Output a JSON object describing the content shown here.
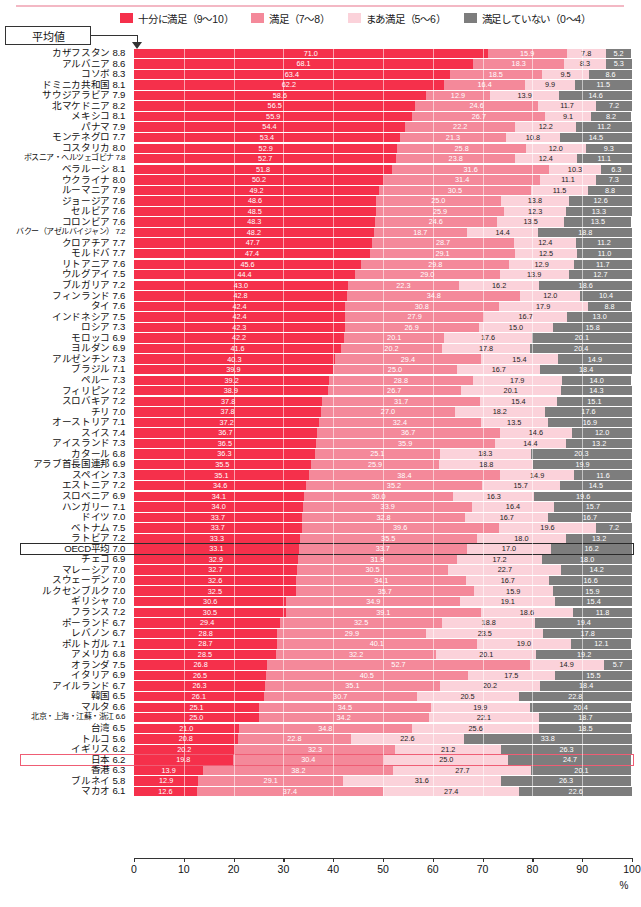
{
  "legend": {
    "items": [
      {
        "label": "十分に満足（9～10）",
        "color": "#f5304b",
        "key": "very_satisfied"
      },
      {
        "label": "満足（7～8）",
        "color": "#f4899a",
        "key": "satisfied"
      },
      {
        "label": "まあ満足（5～6）",
        "color": "#fbd2da",
        "key": "somewhat_satisfied"
      },
      {
        "label": "満足していない（0～4）",
        "color": "#7d7d7d",
        "key": "not_satisfied"
      }
    ]
  },
  "callout": {
    "label": "平均値"
  },
  "axis": {
    "unit": "%",
    "ticks": [
      0,
      10,
      20,
      30,
      40,
      50,
      60,
      70,
      80,
      90,
      100
    ]
  },
  "chart_data": {
    "type": "bar",
    "orientation": "horizontal",
    "stacked": true,
    "title": "",
    "xlabel": "%",
    "ylabel": "",
    "xlim": [
      0,
      100
    ],
    "grid": false,
    "legend_position": "top",
    "series": [
      {
        "name": "十分に満足（9～10）",
        "color": "#f5304b"
      },
      {
        "name": "満足（7～8）",
        "color": "#f4899a"
      },
      {
        "name": "まあ満足（5～6）",
        "color": "#fbd2da"
      },
      {
        "name": "満足していない（0～4）",
        "color": "#7d7d7d"
      }
    ],
    "rows": [
      {
        "name": "カザフスタン",
        "mean": "8.8",
        "values": [
          71.0,
          15.9,
          7.8,
          5.2
        ]
      },
      {
        "name": "アルバニア",
        "mean": "8.6",
        "values": [
          68.1,
          18.3,
          8.3,
          5.3
        ]
      },
      {
        "name": "コソボ",
        "mean": "8.3",
        "values": [
          63.4,
          18.5,
          9.5,
          8.6
        ]
      },
      {
        "name": "ドミニカ共和国",
        "mean": "8.1",
        "values": [
          62.2,
          16.4,
          9.9,
          11.5
        ]
      },
      {
        "name": "サウジアラビア",
        "mean": "7.9",
        "values": [
          58.6,
          12.9,
          13.9,
          14.6
        ]
      },
      {
        "name": "北マケドニア",
        "mean": "8.2",
        "values": [
          56.5,
          24.6,
          11.7,
          7.2
        ]
      },
      {
        "name": "メキシコ",
        "mean": "8.1",
        "values": [
          55.9,
          26.7,
          9.1,
          8.2
        ]
      },
      {
        "name": "パナマ",
        "mean": "7.9",
        "values": [
          54.4,
          22.2,
          12.2,
          11.2
        ]
      },
      {
        "name": "モンテネグロ",
        "mean": "7.7",
        "values": [
          53.4,
          21.3,
          10.8,
          14.5
        ]
      },
      {
        "name": "コスタリカ",
        "mean": "8.0",
        "values": [
          52.9,
          25.8,
          12.0,
          9.3
        ]
      },
      {
        "name": "ボスニア・ヘルツェゴビナ",
        "mean": "7.8",
        "values": [
          52.7,
          23.8,
          12.4,
          11.1
        ]
      },
      {
        "name": "ベラルーシ",
        "mean": "8.1",
        "values": [
          51.8,
          31.6,
          10.3,
          6.3
        ]
      },
      {
        "name": "ウクライナ",
        "mean": "8.0",
        "values": [
          50.2,
          31.4,
          11.1,
          7.3
        ]
      },
      {
        "name": "ルーマニア",
        "mean": "7.9",
        "values": [
          49.2,
          30.5,
          11.5,
          8.8
        ]
      },
      {
        "name": "ジョージア",
        "mean": "7.6",
        "values": [
          48.6,
          25.0,
          13.8,
          12.6
        ]
      },
      {
        "name": "セルビア",
        "mean": "7.6",
        "values": [
          48.5,
          25.9,
          12.3,
          13.3
        ]
      },
      {
        "name": "コロンビア",
        "mean": "7.6",
        "values": [
          48.3,
          24.6,
          13.5,
          13.5
        ]
      },
      {
        "name": "バクー（アゼルバイジャン）",
        "mean": "7.2",
        "values": [
          48.2,
          18.7,
          14.4,
          18.8
        ]
      },
      {
        "name": "クロアチア",
        "mean": "7.7",
        "values": [
          47.7,
          28.7,
          12.4,
          11.2
        ]
      },
      {
        "name": "モルドバ",
        "mean": "7.7",
        "values": [
          47.4,
          29.1,
          12.5,
          11.0
        ]
      },
      {
        "name": "リトアニア",
        "mean": "7.6",
        "values": [
          45.6,
          29.8,
          12.9,
          11.7
        ]
      },
      {
        "name": "ウルグアイ",
        "mean": "7.5",
        "values": [
          44.4,
          29.0,
          13.9,
          12.7
        ]
      },
      {
        "name": "ブルガリア",
        "mean": "7.2",
        "values": [
          43.0,
          22.3,
          16.2,
          18.6
        ]
      },
      {
        "name": "フィンランド",
        "mean": "7.6",
        "values": [
          42.8,
          34.8,
          12.0,
          10.4
        ]
      },
      {
        "name": "タイ",
        "mean": "7.6",
        "values": [
          42.4,
          30.8,
          17.9,
          8.8
        ]
      },
      {
        "name": "インドネシア",
        "mean": "7.5",
        "values": [
          42.4,
          27.9,
          16.7,
          13.0
        ]
      },
      {
        "name": "ロシア",
        "mean": "7.3",
        "values": [
          42.3,
          26.9,
          15.0,
          15.8
        ]
      },
      {
        "name": "モロッコ",
        "mean": "6.9",
        "values": [
          42.2,
          20.1,
          17.6,
          20.1
        ]
      },
      {
        "name": "ヨルダン",
        "mean": "6.9",
        "values": [
          41.6,
          20.2,
          17.8,
          20.4
        ]
      },
      {
        "name": "アルゼンチン",
        "mean": "7.3",
        "values": [
          40.3,
          29.4,
          15.4,
          14.9
        ]
      },
      {
        "name": "ブラジル",
        "mean": "7.1",
        "values": [
          39.9,
          25.0,
          16.7,
          18.4
        ]
      },
      {
        "name": "ペルー",
        "mean": "7.3",
        "values": [
          39.2,
          28.8,
          17.9,
          14.0
        ]
      },
      {
        "name": "フィリピン",
        "mean": "7.2",
        "values": [
          38.9,
          26.7,
          20.1,
          14.3
        ]
      },
      {
        "name": "スロバキア",
        "mean": "7.2",
        "values": [
          37.8,
          31.7,
          15.4,
          15.1
        ]
      },
      {
        "name": "チリ",
        "mean": "7.0",
        "values": [
          37.8,
          27.0,
          18.2,
          17.6
        ]
      },
      {
        "name": "オーストリア",
        "mean": "7.1",
        "values": [
          37.2,
          32.4,
          13.5,
          16.9
        ]
      },
      {
        "name": "スイス",
        "mean": "7.4",
        "values": [
          36.7,
          36.7,
          14.6,
          12.0
        ]
      },
      {
        "name": "アイスランド",
        "mean": "7.3",
        "values": [
          36.5,
          35.9,
          14.4,
          13.2
        ]
      },
      {
        "name": "カタール",
        "mean": "6.8",
        "values": [
          36.3,
          25.1,
          18.3,
          20.3
        ]
      },
      {
        "name": "アラブ首長国連邦",
        "mean": "6.9",
        "values": [
          35.5,
          25.9,
          18.8,
          19.9
        ]
      },
      {
        "name": "スペイン",
        "mean": "7.3",
        "values": [
          35.1,
          38.4,
          14.9,
          11.6
        ]
      },
      {
        "name": "エストニア",
        "mean": "7.2",
        "values": [
          34.6,
          35.2,
          15.7,
          14.5
        ]
      },
      {
        "name": "スロベニア",
        "mean": "6.9",
        "values": [
          34.1,
          30.0,
          16.3,
          19.6
        ]
      },
      {
        "name": "ハンガリー",
        "mean": "7.1",
        "values": [
          34.0,
          33.9,
          16.4,
          15.7
        ]
      },
      {
        "name": "ドイツ",
        "mean": "7.0",
        "values": [
          33.7,
          32.8,
          16.7,
          16.7
        ]
      },
      {
        "name": "ベトナム",
        "mean": "7.5",
        "values": [
          33.7,
          39.6,
          19.6,
          7.2
        ]
      },
      {
        "name": "ラトビア",
        "mean": "7.2",
        "values": [
          33.3,
          35.5,
          18.0,
          13.2
        ]
      },
      {
        "name": "OECD平均",
        "mean": "7.0",
        "values": [
          33.1,
          33.7,
          17.0,
          16.2
        ],
        "highlight": "oecd"
      },
      {
        "name": "チェコ",
        "mean": "6.9",
        "values": [
          32.9,
          31.9,
          17.2,
          18.0
        ]
      },
      {
        "name": "マレーシア",
        "mean": "7.0",
        "values": [
          32.7,
          30.5,
          22.7,
          14.2
        ]
      },
      {
        "name": "スウェーデン",
        "mean": "7.0",
        "values": [
          32.6,
          34.1,
          16.7,
          16.6
        ]
      },
      {
        "name": "ルクセンブルク",
        "mean": "7.0",
        "values": [
          32.5,
          35.7,
          15.9,
          15.9
        ]
      },
      {
        "name": "ギリシャ",
        "mean": "7.0",
        "values": [
          30.6,
          34.9,
          19.1,
          15.4
        ]
      },
      {
        "name": "フランス",
        "mean": "7.2",
        "values": [
          30.5,
          39.1,
          18.6,
          11.8
        ]
      },
      {
        "name": "ポーランド",
        "mean": "6.7",
        "values": [
          29.4,
          32.5,
          18.8,
          19.4
        ]
      },
      {
        "name": "レバノン",
        "mean": "6.7",
        "values": [
          28.8,
          29.9,
          23.5,
          17.8
        ]
      },
      {
        "name": "ポルトガル",
        "mean": "7.1",
        "values": [
          28.7,
          40.1,
          19.0,
          12.1
        ]
      },
      {
        "name": "アメリカ",
        "mean": "6.8",
        "values": [
          28.5,
          32.2,
          20.1,
          19.2
        ]
      },
      {
        "name": "オランダ",
        "mean": "7.5",
        "values": [
          26.8,
          52.7,
          14.9,
          5.7
        ]
      },
      {
        "name": "イタリア",
        "mean": "6.9",
        "values": [
          26.5,
          40.5,
          17.5,
          15.5
        ]
      },
      {
        "name": "アイルランド",
        "mean": "6.7",
        "values": [
          26.3,
          35.1,
          20.2,
          18.4
        ]
      },
      {
        "name": "韓国",
        "mean": "6.5",
        "values": [
          26.1,
          30.7,
          20.5,
          22.8
        ]
      },
      {
        "name": "マルタ",
        "mean": "6.6",
        "values": [
          25.1,
          34.5,
          19.9,
          20.4
        ]
      },
      {
        "name": "北京・上海・江蘇・浙江",
        "mean": "6.6",
        "values": [
          25.0,
          34.2,
          22.1,
          18.7
        ]
      },
      {
        "name": "台湾",
        "mean": "6.5",
        "values": [
          21.0,
          34.8,
          25.6,
          18.5
        ]
      },
      {
        "name": "トルコ",
        "mean": "5.6",
        "values": [
          20.8,
          22.8,
          22.6,
          33.8
        ]
      },
      {
        "name": "イギリス",
        "mean": "6.2",
        "values": [
          20.2,
          32.3,
          21.2,
          26.3
        ]
      },
      {
        "name": "日本",
        "mean": "6.2",
        "values": [
          19.8,
          30.4,
          25.0,
          24.7
        ],
        "highlight": "japan"
      },
      {
        "name": "香港",
        "mean": "6.3",
        "values": [
          13.9,
          38.2,
          27.7,
          20.1
        ]
      },
      {
        "name": "ブルネイ",
        "mean": "5.8",
        "values": [
          12.9,
          29.1,
          31.6,
          26.3
        ]
      },
      {
        "name": "マカオ",
        "mean": "6.1",
        "values": [
          12.6,
          37.4,
          27.4,
          22.6
        ]
      }
    ]
  }
}
